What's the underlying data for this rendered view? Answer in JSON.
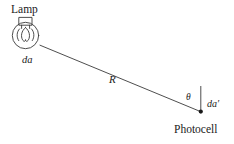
{
  "figure": {
    "kind": "physics-diagram",
    "width": 234,
    "height": 144,
    "background_color": "#ffffff",
    "stroke_color": "#3a3a3a",
    "text_color": "#1a1a1a"
  },
  "labels": {
    "lamp": "Lamp",
    "photocell": "Photocell",
    "source_area": "da",
    "receiver_area": "da′",
    "distance": "R",
    "angle": "θ"
  },
  "elements": {
    "bulb": {
      "name": "light-bulb-icon",
      "center_x": 25,
      "center_y": 35,
      "radius": 13,
      "cap_x": 19,
      "cap_y": 17,
      "cap_width": 13,
      "cap_height": 8
    },
    "ray": {
      "name": "ray-line",
      "x1": 40,
      "y1": 45,
      "x2": 201,
      "y2": 112
    },
    "normal": {
      "name": "surface-normal-line",
      "x1": 201,
      "y1": 112,
      "x2": 201,
      "y2": 86
    },
    "vertex_dot": {
      "name": "photocell-vertex-dot",
      "cx": 201,
      "cy": 112,
      "r": 2.1
    }
  }
}
